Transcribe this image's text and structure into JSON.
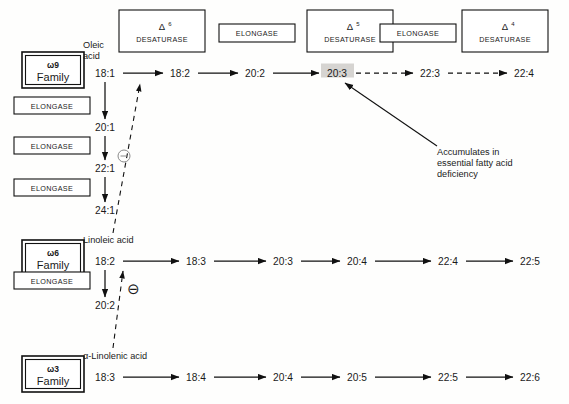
{
  "diagram": {
    "highlight_color": "#d6d4d1",
    "line_color": "#111111"
  },
  "enzymes": {
    "top_row": [
      {
        "name": "delta6-desaturase",
        "delta": "Δ",
        "superscript": "6",
        "line2": "DESATURASE",
        "x": 119,
        "y": 10,
        "w": 86,
        "h": 42
      },
      {
        "name": "elongase-1",
        "label": "ELONGASE",
        "x": 219,
        "y": 24,
        "w": 76,
        "h": 18
      },
      {
        "name": "delta5-desaturase",
        "delta": "Δ",
        "superscript": "5",
        "line2": "DESATURASE",
        "x": 307,
        "y": 10,
        "w": 86,
        "h": 42
      },
      {
        "name": "elongase-2",
        "label": "ELONGASE",
        "x": 407,
        "y": 24,
        "w": 76,
        "h": 18
      },
      {
        "name": "delta4-desaturase",
        "delta": "Δ",
        "superscript": "4",
        "line2": "DESATURASE",
        "x": 462,
        "y": 10,
        "w": 86,
        "h": 42
      }
    ],
    "omega9_column": [
      {
        "name": "elongase-w9-1",
        "label": "ELONGASE",
        "x": 14,
        "y": 97,
        "w": 76,
        "h": 17
      },
      {
        "name": "elongase-w9-2",
        "label": "ELONGASE",
        "x": 14,
        "y": 137,
        "w": 76,
        "h": 17
      },
      {
        "name": "elongase-w9-3",
        "label": "ELONGASE",
        "x": 14,
        "y": 179,
        "w": 76,
        "h": 17
      }
    ],
    "omega6_column": [
      {
        "name": "elongase-w6-1",
        "label": "ELONGASE",
        "x": 14,
        "y": 272,
        "w": 76,
        "h": 17
      }
    ]
  },
  "families": [
    {
      "id": "omega9",
      "omega": "ω9",
      "word": "Family",
      "x": 22,
      "y": 52,
      "w": 62,
      "h": 34
    },
    {
      "id": "omega6",
      "omega": "ω6",
      "word": "Family",
      "x": 22,
      "y": 240,
      "w": 62,
      "h": 34
    },
    {
      "id": "omega3",
      "omega": "ω3",
      "word": "Family",
      "x": 22,
      "y": 356,
      "w": 62,
      "h": 34
    }
  ],
  "rows": {
    "omega9": {
      "acid_name_lines": [
        "Oleic",
        "acid"
      ],
      "acid_name_x": 83,
      "acid_name_y": 48,
      "y": 73,
      "nodes": [
        {
          "label": "18:1",
          "x": 105,
          "highlight": false
        },
        {
          "label": "18:2",
          "x": 180,
          "highlight": false
        },
        {
          "label": "20:2",
          "x": 255,
          "highlight": false
        },
        {
          "label": "20:3",
          "x": 337,
          "highlight": true
        },
        {
          "label": "22:3",
          "x": 430,
          "highlight": false
        },
        {
          "label": "22:4",
          "x": 524,
          "highlight": false
        }
      ],
      "arrow_styles": [
        "solid",
        "solid",
        "solid",
        "dashed",
        "dashed"
      ],
      "vertical_chain": [
        {
          "label": "20:1",
          "x": 105,
          "y": 127
        },
        {
          "label": "22:1",
          "x": 105,
          "y": 168
        },
        {
          "label": "24:1",
          "x": 105,
          "y": 210
        }
      ]
    },
    "omega6": {
      "acid_name_lines": [
        "Linoleic acid"
      ],
      "acid_name_x": 83,
      "acid_name_y": 240,
      "y": 261,
      "nodes": [
        {
          "label": "18:2",
          "x": 105,
          "highlight": false
        },
        {
          "label": "18:3",
          "x": 196,
          "highlight": false
        },
        {
          "label": "20:3",
          "x": 283,
          "highlight": false
        },
        {
          "label": "20:4",
          "x": 357,
          "highlight": false
        },
        {
          "label": "22:4",
          "x": 448,
          "highlight": false
        },
        {
          "label": "22:5",
          "x": 530,
          "highlight": false
        }
      ],
      "arrow_styles": [
        "solid",
        "solid",
        "solid",
        "solid",
        "solid"
      ],
      "vertical_chain": [
        {
          "label": "20:2",
          "x": 105,
          "y": 305
        }
      ]
    },
    "omega3": {
      "acid_name_lines": [
        "α-Linolenic acid"
      ],
      "acid_name_x": 83,
      "acid_name_y": 356,
      "y": 377,
      "nodes": [
        {
          "label": "18:3",
          "x": 105,
          "highlight": false
        },
        {
          "label": "18:4",
          "x": 196,
          "highlight": false
        },
        {
          "label": "20:4",
          "x": 283,
          "highlight": false
        },
        {
          "label": "20:5",
          "x": 357,
          "highlight": false
        },
        {
          "label": "22:5",
          "x": 448,
          "highlight": false
        },
        {
          "label": "22:6",
          "x": 530,
          "highlight": false
        }
      ],
      "arrow_styles": [
        "solid",
        "solid",
        "solid",
        "solid",
        "solid"
      ],
      "vertical_chain": []
    }
  },
  "inhibitions": [
    {
      "id": "w6-inhibits-w9",
      "symbol": "⊖",
      "symbol_x": 124,
      "symbol_y": 156,
      "style": "small-ring"
    },
    {
      "id": "w3-inhibits-w6",
      "symbol": "⊖",
      "symbol_x": 133,
      "symbol_y": 289,
      "style": "glyph"
    }
  ],
  "annotation": {
    "name": "accumulates-note",
    "lines": [
      "Accumulates in",
      "essential fatty acid",
      "deficiency"
    ],
    "x": 437,
    "y": 155
  }
}
